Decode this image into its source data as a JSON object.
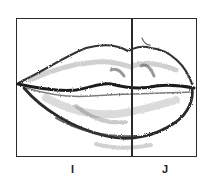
{
  "figure": {
    "labels": [
      "I",
      "J"
    ],
    "colors": {
      "line": "#2a2a2a",
      "shading": "#555555",
      "background": "#ffffff"
    }
  }
}
